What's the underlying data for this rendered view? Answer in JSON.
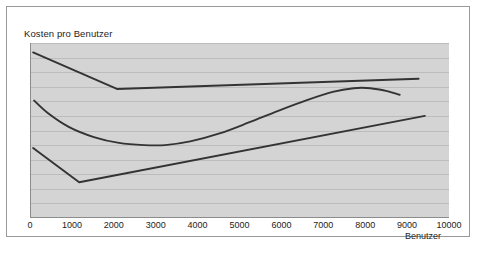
{
  "chart_data": {
    "type": "line",
    "title": "Kosten pro Benutzer",
    "xlabel": "Benutzer",
    "ylabel": "",
    "xlim": [
      0,
      10000
    ],
    "xticks": [
      0,
      1000,
      2000,
      3000,
      4000,
      5000,
      6000,
      7000,
      8000,
      9000,
      10000
    ],
    "xtick_labels": [
      "0",
      "1000",
      "2000",
      "3000",
      "4000",
      "5000",
      "6000",
      "7000",
      "8000",
      "9000",
      "10000"
    ],
    "ylim": [
      0,
      12
    ],
    "yticks": [
      0,
      1,
      2,
      3,
      4,
      5,
      6,
      7,
      8,
      9,
      10,
      11,
      12
    ],
    "ytick_labels": [],
    "grid": "horizontal",
    "legend": "none",
    "plot_background": "#d4d4d4",
    "gridline_color": "#bcbcbc",
    "line_color": "#333333",
    "series": [
      {
        "name": "obere-kurve",
        "style": "polyline",
        "x": [
          50,
          2050,
          9250
        ],
        "y": [
          11.35,
          8.85,
          9.55
        ]
      },
      {
        "name": "mittlere-kurve",
        "style": "smooth",
        "x": [
          75,
          400,
          900,
          1500,
          2100,
          2700,
          3200,
          3800,
          4500,
          5200,
          5900,
          6600,
          7200,
          7700,
          8100,
          8500,
          8800
        ],
        "y": [
          8.05,
          7.2,
          6.25,
          5.55,
          5.15,
          5.0,
          5.0,
          5.25,
          5.8,
          6.55,
          7.35,
          8.1,
          8.65,
          8.9,
          8.9,
          8.7,
          8.45
        ]
      },
      {
        "name": "untere-kurve",
        "style": "polyline",
        "x": [
          50,
          1150,
          9400
        ],
        "y": [
          4.8,
          2.45,
          7.0
        ]
      }
    ]
  },
  "chart": {
    "title": "Kosten pro Benutzer",
    "x_axis_title": "Benutzer",
    "x_tick_labels": [
      "0",
      "1000",
      "2000",
      "3000",
      "4000",
      "5000",
      "6000",
      "7000",
      "8000",
      "9000",
      "10000"
    ]
  }
}
